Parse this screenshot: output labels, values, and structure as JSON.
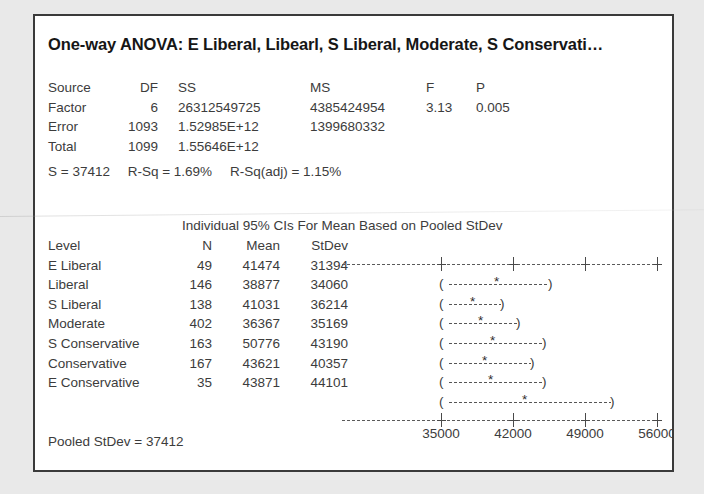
{
  "title": "One-way ANOVA: E Liberal, Libearl, S Liberal, Moderate, S Conservati…",
  "anova": {
    "headers": {
      "source": "Source",
      "df": "DF",
      "ss": "SS",
      "ms": "MS",
      "f": "F",
      "p": "P"
    },
    "rows": [
      {
        "source": "Factor",
        "df": "6",
        "ss": "26312549725",
        "ms": "4385424954",
        "f": "3.13",
        "p": "0.005"
      },
      {
        "source": "Error",
        "df": "1093",
        "ss": "1.52985E+12",
        "ms": "1399680332",
        "f": "",
        "p": ""
      },
      {
        "source": "Total",
        "df": "1099",
        "ss": "1.55646E+12",
        "ms": "",
        "f": "",
        "p": ""
      }
    ]
  },
  "summary": {
    "s": "S = 37412",
    "r_sq": "R-Sq = 1.69%",
    "r_sq_adj": "R-Sq(adj) = 1.15%"
  },
  "ci_section": {
    "header": "Individual 95% CIs For Mean Based on Pooled StDev",
    "columns": {
      "level": "Level",
      "n": "N",
      "mean": "Mean",
      "stdev": "StDev"
    },
    "rows": [
      {
        "level": "E Liberal",
        "n": "49",
        "mean": "41474",
        "stdev": "31394"
      },
      {
        "level": "Liberal",
        "n": "146",
        "mean": "38877",
        "stdev": "34060"
      },
      {
        "level": "S Liberal",
        "n": "138",
        "mean": "41031",
        "stdev": "36214"
      },
      {
        "level": "Moderate",
        "n": "402",
        "mean": "36367",
        "stdev": "35169"
      },
      {
        "level": "S Conservative",
        "n": "163",
        "mean": "50776",
        "stdev": "43190"
      },
      {
        "level": "Conservative",
        "n": "167",
        "mean": "43621",
        "stdev": "40357"
      },
      {
        "level": "E Conservative",
        "n": "35",
        "mean": "43871",
        "stdev": "44101"
      }
    ]
  },
  "pooled_stdev": "Pooled StDev = 37412",
  "chart_data": {
    "type": "line",
    "title": "Individual 95% CIs For Mean Based on Pooled StDev",
    "xlabel": "",
    "ylabel": "",
    "categories": [
      "E Liberal",
      "Liberal",
      "S Liberal",
      "Moderate",
      "S Conservative",
      "Conservative",
      "E Conservative"
    ],
    "values": [
      41474,
      38877,
      41031,
      36367,
      50776,
      43621,
      43871
    ],
    "series": [
      {
        "name": "Mean",
        "values": [
          41474,
          38877,
          41031,
          36367,
          50776,
          43621,
          43871
        ]
      },
      {
        "name": "N",
        "values": [
          49,
          146,
          138,
          402,
          163,
          167,
          35
        ]
      },
      {
        "name": "StDev",
        "values": [
          31394,
          34060,
          36214,
          35169,
          43190,
          40357,
          44101
        ]
      },
      {
        "name": "CI lower",
        "values": [
          30993,
          32930,
          35163,
          32709,
          45045,
          37946,
          31474
        ]
      },
      {
        "name": "CI upper",
        "values": [
          51955,
          44824,
          46899,
          40025,
          56507,
          49296,
          56268
        ]
      }
    ],
    "xticks": [
      35000,
      42000,
      49000,
      56000
    ],
    "xlim": [
      28000,
      59500
    ],
    "grid": false,
    "legend": "none",
    "ci_bars": [
      {
        "label": "E Liberal",
        "lower": 30993,
        "mean": 41474,
        "upper": 51955
      },
      {
        "label": "Liberal",
        "lower": 32930,
        "mean": 38877,
        "upper": 44824
      },
      {
        "label": "S Liberal",
        "lower": 35163,
        "mean": 41031,
        "upper": 46899
      },
      {
        "label": "Moderate",
        "lower": 32709,
        "mean": 36367,
        "upper": 40025
      },
      {
        "label": "S Conservative",
        "lower": 45045,
        "mean": 50776,
        "upper": 56507
      },
      {
        "label": "Conservative",
        "lower": 37946,
        "mean": 43621,
        "upper": 49296
      },
      {
        "label": "E Conservative",
        "lower": 31474,
        "mean": 43871,
        "upper": 56268
      }
    ]
  },
  "plot_geometry": {
    "note": "pixel fractions of plot width for rendering the CI glyph rows as drawn",
    "axis_ticks_px": [
      102,
      174,
      246,
      318
    ],
    "tick_label_px": [
      102,
      174,
      246,
      318
    ],
    "bars_px": [
      {
        "left": 104,
        "center": 158,
        "right": 214
      },
      {
        "left": 104,
        "center": 134,
        "right": 166
      },
      {
        "left": 104,
        "center": 142,
        "right": 182
      },
      {
        "left": 104,
        "center": 154,
        "right": 208
      },
      {
        "left": 104,
        "center": 146,
        "right": 196
      },
      {
        "left": 104,
        "center": 152,
        "right": 208
      },
      {
        "left": 104,
        "center": 186,
        "right": 276
      }
    ]
  }
}
